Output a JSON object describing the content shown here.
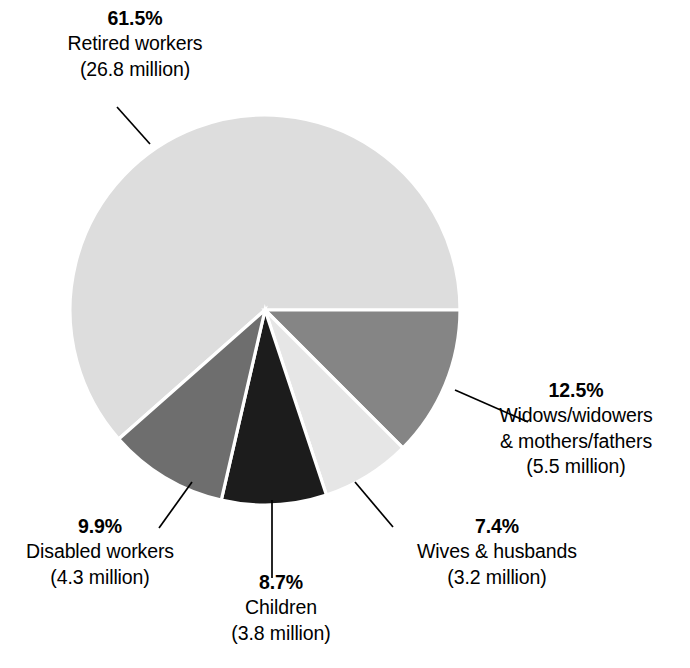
{
  "chart_data": {
    "type": "pie",
    "title": "",
    "subtitle": "",
    "xlabel": "",
    "ylabel": "",
    "legend_position": "none",
    "grid": false,
    "units": "percent of beneficiaries",
    "categories": [
      "Retired workers",
      "Widows/widowers & mothers/fathers",
      "Wives & husbands",
      "Children",
      "Disabled workers"
    ],
    "values": [
      61.5,
      12.5,
      7.4,
      8.7,
      9.9
    ],
    "slices": [
      {
        "id": "retired",
        "percent": "61.5%",
        "value": 61.5,
        "name_line1": "Retired workers",
        "name_line2": "",
        "amount": "(26.8 million)",
        "amount_value": 26.8,
        "color": "#dddddd",
        "start_angle": 90.0,
        "sweep": 221.4
      },
      {
        "id": "widows",
        "percent": "12.5%",
        "value": 12.5,
        "name_line1": "Widows/widowers",
        "name_line2": "& mothers/fathers",
        "amount": "(5.5 million)",
        "amount_value": 5.5,
        "color": "#858585",
        "start_angle": 0.0,
        "sweep": 45.0
      },
      {
        "id": "wives",
        "percent": "7.4%",
        "value": 7.4,
        "name_line1": "Wives & husbands",
        "name_line2": "",
        "amount": "(3.2 million)",
        "amount_value": 3.2,
        "color": "#e6e6e6",
        "start_angle": 45.0,
        "sweep": 26.64
      },
      {
        "id": "children",
        "percent": "8.7%",
        "value": 8.7,
        "name_line1": "Children",
        "name_line2": "",
        "amount": "(3.8 million)",
        "amount_value": 3.8,
        "color": "#1c1c1c",
        "start_angle": 71.64,
        "sweep": 31.32
      },
      {
        "id": "disabled",
        "percent": "9.9%",
        "value": 9.9,
        "name_line1": "Disabled workers",
        "name_line2": "",
        "amount": "(4.3 million)",
        "amount_value": 4.3,
        "color": "#6e6e6e",
        "start_angle": 102.96,
        "sweep": 35.64
      }
    ],
    "colors": [
      "#dddddd",
      "#858585",
      "#e6e6e6",
      "#1c1c1c",
      "#6e6e6e"
    ],
    "separator_color": "#ffffff",
    "background": "#ffffff",
    "text_color": "#000000"
  }
}
